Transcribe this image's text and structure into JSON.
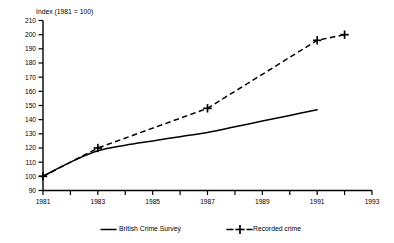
{
  "chart_data": {
    "type": "line",
    "title": "",
    "ylabel": "Index (1981 = 100)",
    "xlabel": "",
    "ylim": [
      90,
      210
    ],
    "xlim": [
      1981,
      1993
    ],
    "grid": false,
    "legend_position": "bottom",
    "y_ticks": [
      90,
      100,
      110,
      120,
      130,
      140,
      150,
      160,
      170,
      180,
      190,
      200,
      210
    ],
    "x_ticks": [
      1981,
      1982,
      1983,
      1984,
      1985,
      1986,
      1987,
      1988,
      1989,
      1990,
      1991,
      1992,
      1993
    ],
    "x_tick_labels": [
      "1981",
      "",
      "1983",
      "",
      "1985",
      "",
      "1987",
      "",
      "1989",
      "",
      "1991",
      "",
      "1993"
    ],
    "series": [
      {
        "name": "British Crime Survey",
        "style": "solid",
        "marker": "none",
        "x": [
          1981,
          1982,
          1983,
          1984,
          1985,
          1986,
          1987,
          1988,
          1989,
          1990,
          1991
        ],
        "values": [
          100,
          110,
          118,
          122,
          125,
          128,
          131,
          135,
          139,
          143,
          147
        ]
      },
      {
        "name": "Recorded crime",
        "style": "dashed",
        "marker": "plus",
        "x": [
          1981,
          1983,
          1987,
          1991,
          1992
        ],
        "values": [
          100,
          120,
          148,
          196,
          200
        ]
      }
    ]
  },
  "legend": {
    "items": [
      {
        "label": "British Crime Survey",
        "style": "solid",
        "marker": "none"
      },
      {
        "label": "Recorded crime",
        "style": "dashed",
        "marker": "plus"
      }
    ]
  },
  "colors": {
    "line": "#000000",
    "background": "#ffffff",
    "axis": "#000000"
  }
}
